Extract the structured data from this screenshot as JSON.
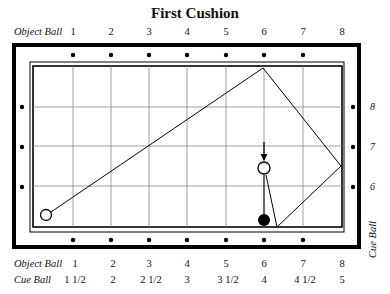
{
  "title": "First Cushion",
  "top_axis": {
    "label": "Object Ball",
    "ticks": [
      "1",
      "2",
      "3",
      "4",
      "5",
      "6",
      "7",
      "8"
    ]
  },
  "bottom_axis": {
    "object_label": "Object Ball",
    "object_ticks": [
      "1",
      "2",
      "3",
      "4",
      "5",
      "6",
      "7",
      "8"
    ],
    "cue_label": "Cue Ball",
    "cue_ticks": [
      "1 1/2",
      "2",
      "2 1/2",
      "3",
      "3 1/2",
      "4",
      "4 1/2",
      "5"
    ]
  },
  "right_axis": {
    "label": "Cue Ball",
    "ticks": [
      "8",
      "7",
      "6"
    ]
  },
  "table": {
    "colors": {
      "rail": "#000000",
      "grid": "#888888",
      "cloth": "#ffffff",
      "ball_dark": "#000000"
    },
    "object_ball_start": {
      "x": 46,
      "y": 215
    },
    "first_cushion_point": {
      "x": 263,
      "y": 68
    },
    "right_cushion_point": {
      "x": 341,
      "y": 166
    },
    "bottom_cushion_point": {
      "x": 277,
      "y": 227
    },
    "white_ball": {
      "x": 264,
      "y": 168
    },
    "black_ball": {
      "x": 264,
      "y": 220
    }
  }
}
